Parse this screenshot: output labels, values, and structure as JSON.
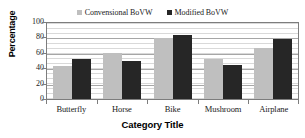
{
  "chart_data": {
    "type": "bar",
    "title": "",
    "xlabel": "Category Title",
    "ylabel": "Percentage",
    "categories": [
      "Butterfly",
      "Horse",
      "Bike",
      "Mushroom",
      "Airplane"
    ],
    "series": [
      {
        "name": "Convensional BoVW",
        "color": "#bfbfbf",
        "values": [
          44,
          61,
          80,
          53,
          67
        ]
      },
      {
        "name": "Modified BoVW",
        "color": "#262626",
        "values": [
          52,
          50,
          84,
          45,
          79
        ]
      }
    ],
    "ylim": [
      0,
      100
    ],
    "yticks": [
      0,
      20,
      40,
      60,
      80,
      100
    ],
    "ytick_labels": [
      "0",
      "20",
      "40",
      "60",
      "80",
      "100"
    ],
    "grid": true,
    "legend_position": "top-center"
  },
  "legend": {
    "items": [
      {
        "label": "Convensional BoVW",
        "color": "#bfbfbf"
      },
      {
        "label": "Modified BoVW",
        "color": "#262626"
      }
    ]
  },
  "axes": {
    "y_title": "Percentage",
    "x_title": "Category Title"
  },
  "colors": {
    "conventional": "#bfbfbf",
    "modified": "#262626",
    "gridline": "#d9d9d9",
    "axis": "#7d7d7d"
  }
}
